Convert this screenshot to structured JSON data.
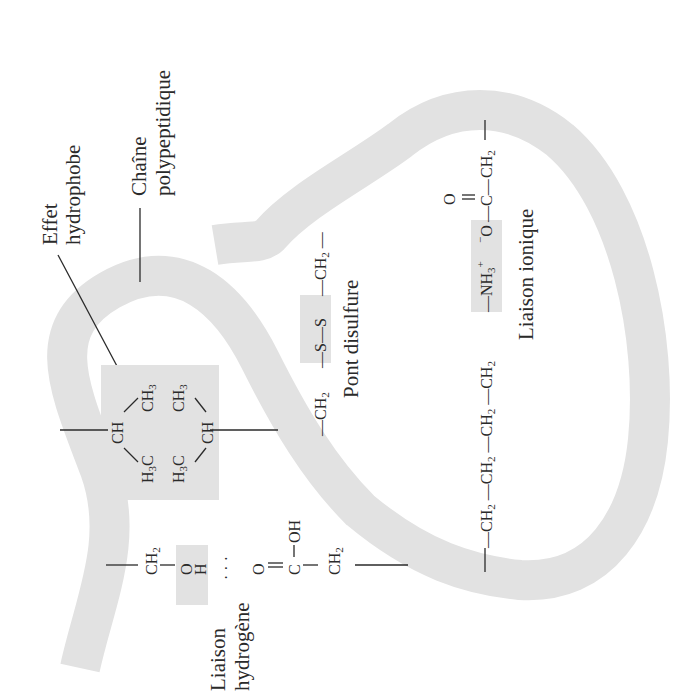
{
  "diagram": {
    "orientation": "rotated -90 degrees (text reads bottom-to-top)",
    "colors": {
      "ribbon": "#e2e2e2",
      "highlight_box": "#e2e2e2",
      "ink": "#2a2a2a",
      "background": "#ffffff"
    },
    "labels": {
      "effet_line1": "Effet",
      "effet_line2": "hydrophobe",
      "chaine_line1": "Chaîne",
      "chaine_line2": "polypeptidique",
      "pont": "Pont disulfure",
      "ionique": "Liaison ionique",
      "hydrogene_line1": "Liaison",
      "hydrogene_line2": "hydrogène"
    },
    "hydrophobic": {
      "ch_left": "CH",
      "ch3_a": "CH",
      "ch3_a_sub": "3",
      "h3c_a": "H",
      "h3c_a_sub": "3",
      "h3c_a_c": "C",
      "ch3_b": "CH",
      "ch3_b_sub": "3",
      "h3c_b": "H",
      "h3c_b_sub": "3",
      "h3c_b_c": "C",
      "ch_right": "CH"
    },
    "disulfide": {
      "ch2_left": "—CH",
      "ch2_left_sub": "2",
      "s1": "—S—",
      "s2": "S",
      "ch2_right": "—CH",
      "ch2_right_sub": "2",
      "tail": " —"
    },
    "ionic": {
      "chain": [
        "—CH",
        "—CH",
        "—CH",
        "—CH"
      ],
      "chain_sub": "2",
      "nh3": "—NH",
      "nh3_sub": "3",
      "nh3_sup": "+",
      "o_minus": "O",
      "o_minus_sup": "−",
      "c": "—C—",
      "o_double": "O",
      "ch2_end": "CH",
      "ch2_end_sub": "2",
      "tail": "—"
    },
    "hbond": {
      "ch2_left": "CH",
      "ch2_left_sub": "2",
      "o": "—O",
      "h": "H",
      "dots": "· · ·",
      "o2": "O",
      "c": "C",
      "oh": "OH",
      "ch2_right": "CH",
      "ch2_right_sub": "2"
    }
  }
}
